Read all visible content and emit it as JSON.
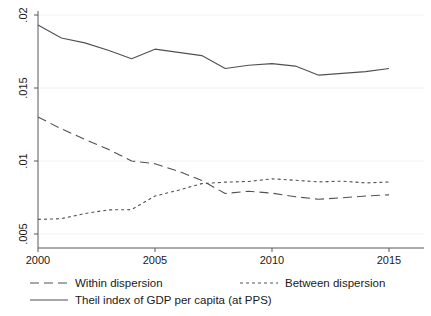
{
  "chart_data": {
    "type": "line",
    "title": "",
    "xlabel": "",
    "ylabel": "",
    "xlim": [
      2000,
      2015
    ],
    "ylim": [
      0.005,
      0.02
    ],
    "grid": true,
    "legend_position": "bottom",
    "x": [
      2000,
      2001,
      2002,
      2003,
      2004,
      2005,
      2006,
      2007,
      2008,
      2009,
      2010,
      2011,
      2012,
      2013,
      2014,
      2015
    ],
    "xticks": [
      "2000",
      "2005",
      "2010",
      "2015"
    ],
    "xtick_values": [
      2000,
      2005,
      2010,
      2015
    ],
    "yticks": [
      ".005",
      ".01",
      ".015",
      ".02"
    ],
    "ytick_values": [
      0.005,
      0.01,
      0.015,
      0.02
    ],
    "series": [
      {
        "name": "Theil index of GDP per capita (at PPS)",
        "style": "solid",
        "color": "#4d5256",
        "values": [
          0.01932,
          0.01843,
          0.01809,
          0.01759,
          0.01701,
          0.01766,
          0.01744,
          0.01722,
          0.01634,
          0.01656,
          0.01667,
          0.0165,
          0.01588,
          0.016,
          0.01612,
          0.01634
        ]
      },
      {
        "name": "Within dispersion",
        "style": "long-dash",
        "color": "#4d5256",
        "values": [
          0.01301,
          0.0122,
          0.01149,
          0.0108,
          0.01,
          0.00981,
          0.0093,
          0.00867,
          0.00777,
          0.00793,
          0.0078,
          0.00755,
          0.00738,
          0.00748,
          0.0076,
          0.00768
        ]
      },
      {
        "name": "Between dispersion",
        "style": "short-dash",
        "color": "#4d5256",
        "values": [
          0.006,
          0.00605,
          0.0064,
          0.00665,
          0.00667,
          0.0076,
          0.008,
          0.00845,
          0.00855,
          0.0086,
          0.00878,
          0.00868,
          0.00857,
          0.00862,
          0.0085,
          0.00856
        ]
      }
    ]
  },
  "axes": {
    "y_tick_labels": [
      ".02",
      ".015",
      ".01",
      ".005"
    ],
    "x_tick_labels": [
      "2000",
      "2005",
      "2010",
      "2015"
    ]
  },
  "legend": {
    "entries": [
      {
        "label": "Within dispersion",
        "style": "long-dash"
      },
      {
        "label": "Between dispersion",
        "style": "short-dash"
      },
      {
        "label": "Theil index of GDP per capita (at PPS)",
        "style": "solid"
      }
    ]
  }
}
